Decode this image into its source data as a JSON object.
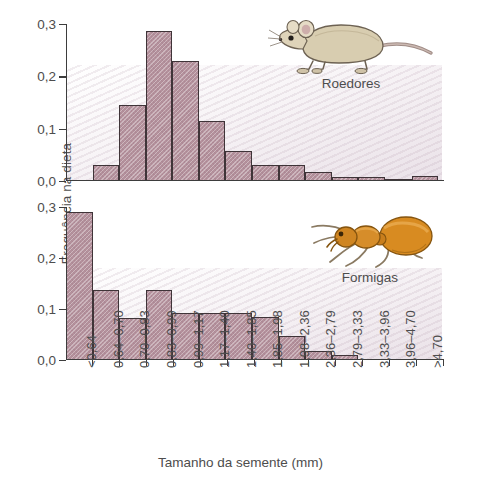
{
  "axes": {
    "y_title": "Frequência na dieta",
    "x_title": "Tamanho da semente (mm)",
    "y_ticks": [
      "0,3",
      "0,2",
      "0,1",
      "0,0"
    ]
  },
  "credit": "ADAPTADA DE BROWN & DAVIDSON, 1977",
  "species": {
    "rodent": {
      "label": "Roedores",
      "icon": "rodent-illustration"
    },
    "ant": {
      "label": "Formigas",
      "icon": "ant-illustration"
    }
  },
  "colors": {
    "bar_fill": "#b4919c",
    "bar_stroke": "#3f3438",
    "axis": "#3d3d3d",
    "text": "#4d4d4d",
    "wash": "#c6acbe"
  },
  "chart_data": {
    "type": "bar",
    "title": "",
    "xlabel": "Tamanho da semente (mm)",
    "ylabel": "Frequência na dieta",
    "ylim": [
      0,
      0.3
    ],
    "yticks": [
      0.0,
      0.1,
      0.2,
      0.3
    ],
    "grid": false,
    "legend_position": "inside-right",
    "categories": [
      "<0,64",
      "0,64–0,70",
      "0,70–0,83",
      "0,83–0,99",
      "0,99–1,17",
      "1,17–1,40",
      "1,40–1,85",
      "1,85–1,98",
      "1,98–2,36",
      "2,36–2,79",
      "2,79–3,33",
      "3,33–3,96",
      "3,96–4,70",
      ">4,70"
    ],
    "panels": [
      {
        "name": "Roedores",
        "values": [
          0,
          0.03,
          0.145,
          0.287,
          0.23,
          0.115,
          0.058,
          0.03,
          0.03,
          0.018,
          0.008,
          0.008,
          0.003,
          0.01
        ]
      },
      {
        "name": "Formigas",
        "values": [
          0.29,
          0.137,
          0.082,
          0.137,
          0.093,
          0.093,
          0.093,
          0.085,
          0.047,
          0.017,
          0.01,
          0,
          0,
          0
        ]
      }
    ]
  }
}
